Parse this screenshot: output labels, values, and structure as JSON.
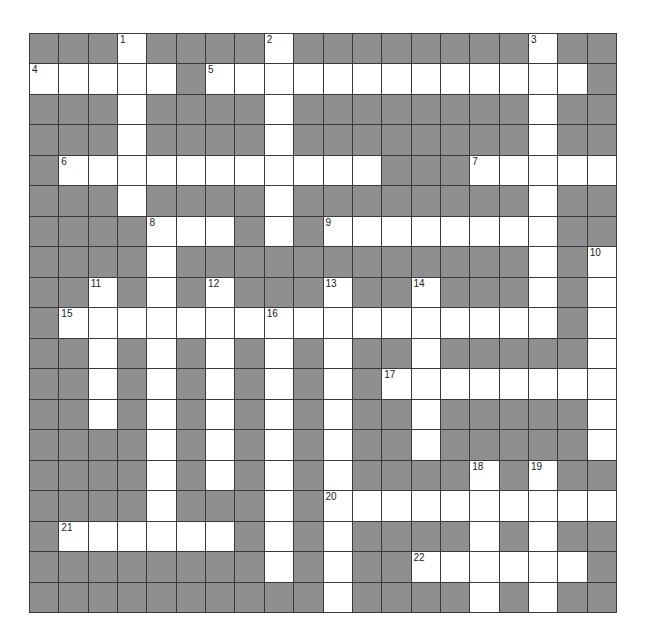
{
  "puzzle": {
    "type": "crossword",
    "rows": 19,
    "cols": 20,
    "colors": {
      "block": "#8f8f8f",
      "open": "#ffffff",
      "line": "#3a3a3a"
    },
    "open_cells": {
      "0": [
        3,
        8,
        17
      ],
      "1": [
        0,
        1,
        2,
        3,
        4,
        6,
        7,
        8,
        9,
        10,
        11,
        12,
        13,
        14,
        15,
        16,
        17,
        18
      ],
      "2": [
        3,
        8,
        17
      ],
      "3": [
        3,
        8,
        17
      ],
      "4": [
        1,
        2,
        3,
        4,
        5,
        6,
        7,
        8,
        9,
        10,
        11,
        15,
        16,
        17,
        18,
        19
      ],
      "5": [
        3,
        8,
        17
      ],
      "6": [
        4,
        5,
        6,
        8,
        10,
        11,
        12,
        13,
        14,
        15,
        16,
        17
      ],
      "7": [
        4,
        17,
        19
      ],
      "8": [
        2,
        4,
        6,
        10,
        13,
        17,
        19
      ],
      "9": [
        1,
        2,
        3,
        4,
        5,
        6,
        7,
        8,
        9,
        10,
        11,
        12,
        13,
        14,
        15,
        16,
        17,
        19
      ],
      "10": [
        2,
        4,
        6,
        8,
        10,
        13,
        19
      ],
      "11": [
        2,
        4,
        6,
        8,
        10,
        12,
        13,
        14,
        15,
        16,
        17,
        18,
        19
      ],
      "12": [
        2,
        4,
        6,
        8,
        10,
        13,
        19
      ],
      "13": [
        4,
        6,
        8,
        10,
        13,
        19
      ],
      "14": [
        4,
        6,
        8,
        10,
        15,
        17
      ],
      "15": [
        4,
        8,
        10,
        11,
        12,
        13,
        14,
        15,
        16,
        17,
        18,
        19
      ],
      "16": [
        1,
        2,
        3,
        4,
        5,
        6,
        8,
        10,
        15,
        17
      ],
      "17": [
        8,
        10,
        13,
        14,
        15,
        16,
        17,
        18
      ],
      "18": [
        10,
        15,
        17
      ]
    },
    "numbers": [
      {
        "n": "1",
        "r": 0,
        "c": 3
      },
      {
        "n": "2",
        "r": 0,
        "c": 8
      },
      {
        "n": "3",
        "r": 0,
        "c": 17
      },
      {
        "n": "4",
        "r": 1,
        "c": 0
      },
      {
        "n": "5",
        "r": 1,
        "c": 6
      },
      {
        "n": "6",
        "r": 4,
        "c": 1
      },
      {
        "n": "7",
        "r": 4,
        "c": 15
      },
      {
        "n": "8",
        "r": 6,
        "c": 4
      },
      {
        "n": "9",
        "r": 6,
        "c": 10
      },
      {
        "n": "10",
        "r": 7,
        "c": 19
      },
      {
        "n": "11",
        "r": 8,
        "c": 2
      },
      {
        "n": "12",
        "r": 8,
        "c": 6
      },
      {
        "n": "13",
        "r": 8,
        "c": 10
      },
      {
        "n": "14",
        "r": 8,
        "c": 13
      },
      {
        "n": "15",
        "r": 9,
        "c": 1
      },
      {
        "n": "16",
        "r": 9,
        "c": 8
      },
      {
        "n": "17",
        "r": 11,
        "c": 12
      },
      {
        "n": "18",
        "r": 14,
        "c": 15
      },
      {
        "n": "19",
        "r": 14,
        "c": 17
      },
      {
        "n": "20",
        "r": 15,
        "c": 10
      },
      {
        "n": "21",
        "r": 16,
        "c": 1
      },
      {
        "n": "22",
        "r": 17,
        "c": 13
      }
    ]
  }
}
